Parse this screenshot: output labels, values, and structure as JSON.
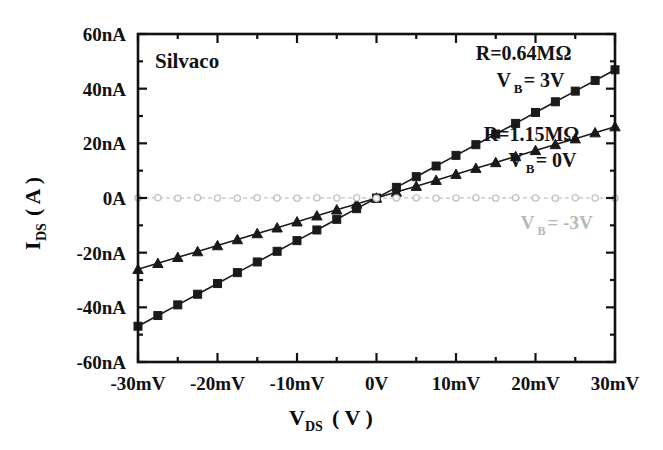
{
  "chart_data": {
    "type": "line",
    "title": "",
    "watermark": "Silvaco",
    "xlabel": "V_DS ( V )",
    "xlabel_main": "V",
    "xlabel_sub": "DS",
    "xlabel_unit": "( V )",
    "ylabel": "I_DS ( A )",
    "ylabel_main": "I",
    "ylabel_sub": "DS",
    "ylabel_unit": "( A )",
    "xlim": [
      -30,
      30
    ],
    "ylim": [
      -60,
      60
    ],
    "x_unit": "mV",
    "y_unit": "nA",
    "grid": false,
    "legend_position": "in-plot-annotations",
    "x_tick_labels": [
      "-30mV",
      "-20mV",
      "-10mV",
      "0V",
      "10mV",
      "20mV",
      "30mV"
    ],
    "x_tick_values": [
      -30,
      -20,
      -10,
      0,
      10,
      20,
      30
    ],
    "x_minor_step": 5,
    "y_tick_labels": [
      "60nA",
      "40nA",
      "20nA",
      "0A",
      "-20nA",
      "-40nA",
      "-60nA"
    ],
    "y_tick_values": [
      60,
      40,
      20,
      0,
      -20,
      -40,
      -60
    ],
    "y_minor_step": 10,
    "x": [
      -30,
      -27.5,
      -25,
      -22.5,
      -20,
      -17.5,
      -15,
      -12.5,
      -10,
      -7.5,
      -5,
      -2.5,
      0,
      2.5,
      5,
      7.5,
      10,
      12.5,
      15,
      17.5,
      20,
      22.5,
      25,
      27.5,
      30
    ],
    "series": [
      {
        "name": "V_B = 3V",
        "marker": "square",
        "resistance": "R=0.64MΩ",
        "color": "#1a1a1a",
        "values": [
          -46.9,
          -43.0,
          -39.1,
          -35.2,
          -31.3,
          -27.3,
          -23.4,
          -19.5,
          -15.6,
          -11.7,
          -7.8,
          -3.9,
          0.0,
          3.9,
          7.8,
          11.7,
          15.6,
          19.5,
          23.4,
          27.3,
          31.3,
          35.2,
          39.1,
          43.0,
          46.9
        ]
      },
      {
        "name": "V_B = 0V",
        "marker": "triangle",
        "resistance": "R=1.15MΩ",
        "color": "#1a1a1a",
        "values": [
          -26.1,
          -23.9,
          -21.7,
          -19.6,
          -17.4,
          -15.2,
          -13.0,
          -10.9,
          -8.7,
          -6.5,
          -4.3,
          -2.2,
          0.0,
          2.2,
          4.3,
          6.5,
          8.7,
          10.9,
          13.0,
          15.2,
          17.4,
          19.6,
          21.7,
          23.9,
          26.1
        ]
      },
      {
        "name": "V_B = -3V",
        "marker": "open-circle",
        "resistance": "",
        "color": "#c4c4c4",
        "values": [
          0.0,
          0.1,
          -0.1,
          0.1,
          0.0,
          -0.1,
          0.1,
          0.0,
          -0.1,
          0.1,
          0.0,
          0.1,
          -0.1,
          0.0,
          0.1,
          -0.1,
          0.0,
          0.1,
          -0.1,
          0.1,
          0.0,
          -0.1,
          0.1,
          0.0,
          -0.1
        ]
      }
    ],
    "annotations": [
      {
        "id": "anno-r-064",
        "text": "R=0.64MΩ",
        "x": 18.5,
        "y": 50.5,
        "style": "dark"
      },
      {
        "id": "anno-vb-3v",
        "text": "V",
        "sub": "B",
        "tail": " = 3V",
        "x": 16.0,
        "y": 40.5,
        "style": "dark"
      },
      {
        "id": "anno-r-115",
        "text": "R=1.15MΩ",
        "x": 19.5,
        "y": 21.0,
        "style": "dark"
      },
      {
        "id": "anno-vb-0v",
        "text": "V",
        "sub": "B",
        "tail": " = 0V",
        "x": 17.5,
        "y": 11.5,
        "style": "dark"
      },
      {
        "id": "anno-vb-m3v",
        "text": "V",
        "sub": "B",
        "tail": " = -3V",
        "x": 19.0,
        "y": -11.5,
        "style": "faint"
      }
    ]
  }
}
